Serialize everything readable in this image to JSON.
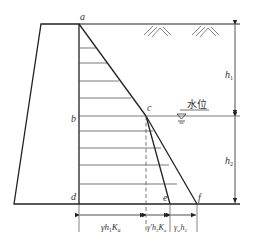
{
  "diagram": {
    "points": {
      "a": "a",
      "b": "b",
      "c": "c",
      "d": "d",
      "e": "e",
      "f": "f"
    },
    "water_level_label": "水位",
    "heights": {
      "h1": "h",
      "h1_sub": "1",
      "h2": "h",
      "h2_sub": "2"
    },
    "bottom_dimensions": [
      {
        "main": "γh",
        "sub1": "1",
        "mid": "K",
        "sub2": "a"
      },
      {
        "main": "γ′h",
        "sub1": "2",
        "mid": "K",
        "sub2": "a"
      },
      {
        "main": "γ",
        "sub1": "w",
        "mid": "h",
        "sub2": "2"
      }
    ],
    "colors": {
      "line": "#222222",
      "hatch": "#555555",
      "text": "#333333"
    }
  }
}
